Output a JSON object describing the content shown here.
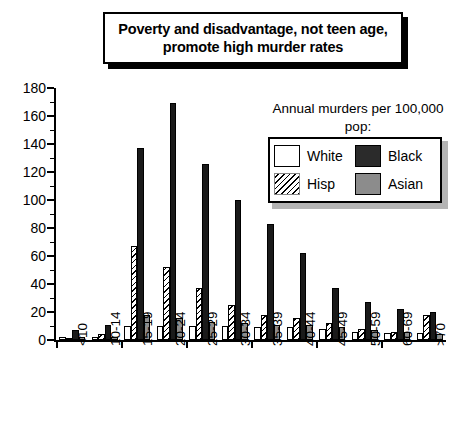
{
  "title": {
    "text": "Poverty and disadvantage, not teen age, promote high murder rates"
  },
  "legend": {
    "heading": "Annual murders per 100,000 pop:",
    "entries": [
      {
        "label": "White",
        "swatch": "white-swatch"
      },
      {
        "label": "Black",
        "swatch": "black-swatch"
      },
      {
        "label": "Hisp",
        "swatch": "hisp-hatch-swatch"
      },
      {
        "label": "Asian",
        "swatch": "asian-swatch"
      }
    ]
  },
  "chart_data": {
    "type": "bar",
    "title": "Poverty and disadvantage, not teen age, promote high murder rates",
    "xlabel": "",
    "ylabel": "",
    "ylim": [
      0,
      180
    ],
    "ytick_step": 20,
    "yticks": [
      0,
      20,
      40,
      60,
      80,
      100,
      120,
      140,
      160,
      180
    ],
    "ytick_labels": [
      "0",
      "20",
      "40",
      "60",
      "80",
      "100",
      "120",
      "140",
      "160",
      "180"
    ],
    "grid": false,
    "legend_position": "upper-right",
    "legend_title": "Annual murders per 100,000 pop:",
    "categories": [
      "<10",
      "10-14",
      "15-19",
      "20-24",
      "25-29",
      "30-34",
      "35-39",
      "40-44",
      "45-49",
      "50-59",
      "60-69",
      ">70"
    ],
    "series": [
      {
        "name": "White",
        "color": "#ffffff",
        "values": [
          2,
          2,
          10,
          10,
          10,
          10,
          9,
          9,
          8,
          6,
          5,
          5
        ]
      },
      {
        "name": "Hisp",
        "color": "#ffffff",
        "values": [
          1,
          4,
          67,
          52,
          37,
          25,
          18,
          16,
          12,
          8,
          6,
          18
        ]
      },
      {
        "name": "Black",
        "color": "#1a1a1a",
        "values": [
          7,
          11,
          137,
          169,
          126,
          100,
          83,
          62,
          37,
          27,
          22,
          20
        ]
      },
      {
        "name": "Asian",
        "color": "#8c8c8c",
        "values": [
          2,
          2,
          18,
          16,
          13,
          12,
          11,
          11,
          9,
          7,
          6,
          4
        ]
      }
    ]
  }
}
